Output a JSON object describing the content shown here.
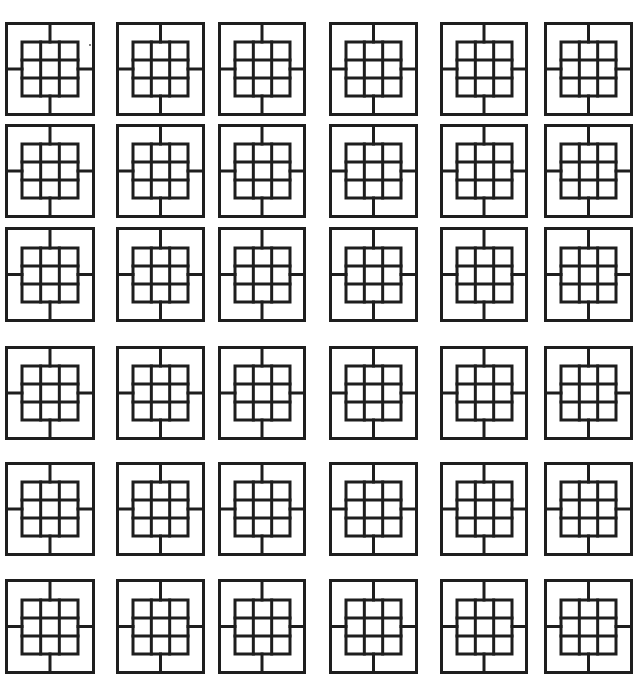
{
  "page": {
    "background": "#ffffff",
    "line_color": "#1e1e1e",
    "layout": "6x6 grid of identical tile figures"
  },
  "tile_design": {
    "description": "outer square divided by four spokes at edge midpoints, surrounding a central 3x3 grid",
    "inner_grid": {
      "rows": 3,
      "cols": 3
    },
    "inner_ratio_w": 0.62,
    "inner_ratio_h": 0.57
  },
  "columns_x": [
    {
      "left": 5,
      "width": 90
    },
    {
      "left": 116,
      "width": 89
    },
    {
      "left": 218,
      "width": 88
    },
    {
      "left": 329,
      "width": 89
    },
    {
      "left": 440,
      "width": 88
    },
    {
      "left": 544,
      "width": 89
    }
  ],
  "rows_y": [
    {
      "top": 22,
      "height": 94
    },
    {
      "top": 124,
      "height": 94
    },
    {
      "top": 227,
      "height": 95
    },
    {
      "top": 346,
      "height": 94
    },
    {
      "top": 462,
      "height": 94
    },
    {
      "top": 579,
      "height": 95
    }
  ],
  "specks": [
    {
      "x": 89,
      "y": 44
    }
  ]
}
